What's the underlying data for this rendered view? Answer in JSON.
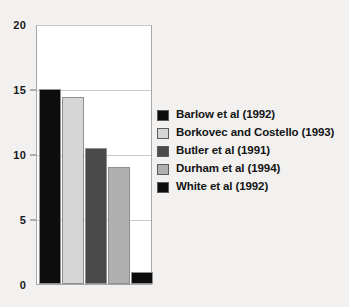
{
  "chart_data": {
    "type": "bar",
    "title": "",
    "subtitle": "",
    "xlabel": "",
    "ylabel": "",
    "categories": [
      "Barlow et al (1992)",
      "Borkovec and Costello (1993)",
      "Butler et al (1991)",
      "Durham et al (1994)",
      "White et al (1992)"
    ],
    "values": [
      15.0,
      14.4,
      10.5,
      9.0,
      0.9
    ],
    "colors": [
      "#0d0d0d",
      "#d6d6d6",
      "#4a4a4a",
      "#b0b0b0",
      "#0d0d0d"
    ],
    "ylim": [
      0,
      20
    ],
    "yticks": [
      0,
      5,
      10,
      15,
      20
    ],
    "ytick_labels": [
      "0",
      "5",
      "10",
      "15",
      "20"
    ],
    "grid": true,
    "xtick_labels": [],
    "legend_position": "right",
    "legend": [
      {
        "label": "Barlow et al (1992)",
        "color": "#0d0d0d"
      },
      {
        "label": "Borkovec and Costello (1993)",
        "color": "#d6d6d6"
      },
      {
        "label": "Butler et al (1991)",
        "color": "#4a4a4a"
      },
      {
        "label": "Durham et al (1994)",
        "color": "#b0b0b0"
      },
      {
        "label": "White et al (1992)",
        "color": "#0d0d0d"
      }
    ]
  }
}
